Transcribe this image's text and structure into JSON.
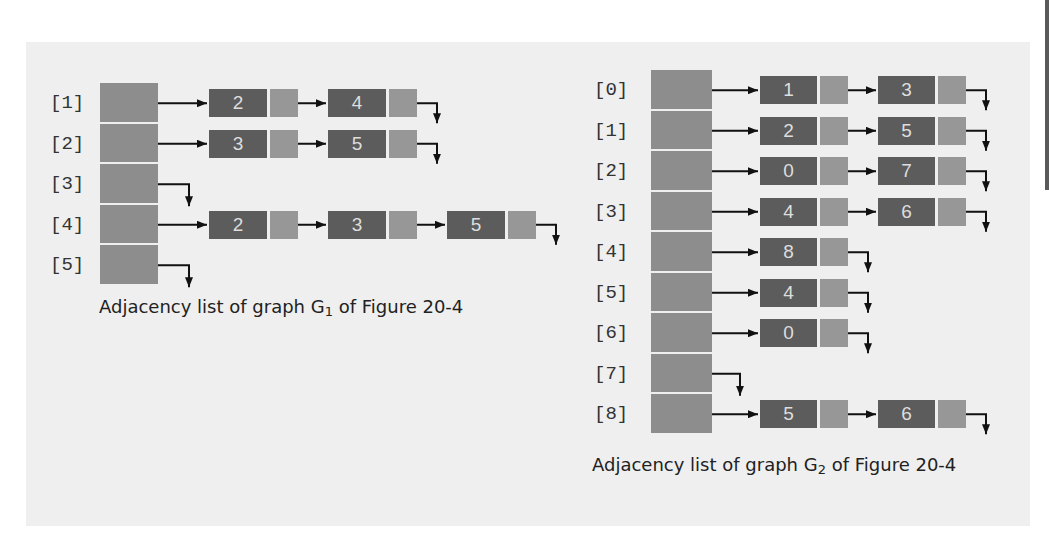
{
  "colors": {
    "panel_bg": "#efefef",
    "array_cell": "#8d8d8d",
    "node_data": "#5c5c5c",
    "node_link": "#979797",
    "arrow": "#111111"
  },
  "graph_g1": {
    "caption_prefix": "Adjacency list of graph G",
    "caption_sub": "1",
    "caption_suffix": " of Figure 20-4",
    "rows": [
      {
        "label": "[1]",
        "nodes": [
          "2",
          "4"
        ]
      },
      {
        "label": "[2]",
        "nodes": [
          "3",
          "5"
        ]
      },
      {
        "label": "[3]",
        "nodes": []
      },
      {
        "label": "[4]",
        "nodes": [
          "2",
          "3",
          "5"
        ]
      },
      {
        "label": "[5]",
        "nodes": []
      }
    ]
  },
  "graph_g2": {
    "caption_prefix": "Adjacency list of graph G",
    "caption_sub": "2",
    "caption_suffix": " of Figure 20-4",
    "rows": [
      {
        "label": "[0]",
        "nodes": [
          "1",
          "3"
        ]
      },
      {
        "label": "[1]",
        "nodes": [
          "2",
          "5"
        ]
      },
      {
        "label": "[2]",
        "nodes": [
          "0",
          "7"
        ]
      },
      {
        "label": "[3]",
        "nodes": [
          "4",
          "6"
        ]
      },
      {
        "label": "[4]",
        "nodes": [
          "8"
        ]
      },
      {
        "label": "[5]",
        "nodes": [
          "4"
        ]
      },
      {
        "label": "[6]",
        "nodes": [
          "0"
        ]
      },
      {
        "label": "[7]",
        "nodes": []
      },
      {
        "label": "[8]",
        "nodes": [
          "5",
          "6"
        ]
      }
    ]
  }
}
